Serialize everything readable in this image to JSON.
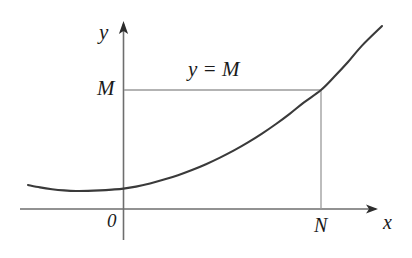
{
  "figure": {
    "kind": "function-graph",
    "width": 412,
    "height": 258,
    "background_color": "#ffffff"
  },
  "labels": {
    "y_axis": "y",
    "x_axis": "x",
    "origin": "0",
    "threshold_value": "M",
    "threshold_line": "y = M",
    "threshold_abscissa": "N"
  },
  "colors": {
    "curve": "#3a3a3a",
    "axis": "#6e6e6e",
    "guide_line": "#9a9a9a",
    "text": "#1a1a1a"
  },
  "chart_data": {
    "type": "line",
    "title": "",
    "xlabel": "x",
    "ylabel": "y",
    "grid": false,
    "legend": null,
    "axes": {
      "x_axis_pixel_y": 209,
      "y_axis_pixel_x": 123.5,
      "x_axis_start_px": 20,
      "x_axis_arrow_tip_px": 378,
      "y_axis_arrow_tip_px": 22,
      "y_axis_bottom_px": 240,
      "origin_px": [
        123.5,
        209
      ]
    },
    "series": [
      {
        "name": "f(x)",
        "description": "convex increasing curve with shallow minimum left of the y-axis",
        "points_px": [
          [
            28,
            185.0
          ],
          [
            40,
            187.4
          ],
          [
            52,
            189.2
          ],
          [
            64,
            190.4
          ],
          [
            76,
            191.0
          ],
          [
            88,
            190.9
          ],
          [
            100,
            190.4
          ],
          [
            112,
            189.6
          ],
          [
            123.5,
            188.6
          ],
          [
            136,
            186.6
          ],
          [
            150,
            183.4
          ],
          [
            164,
            179.6
          ],
          [
            178,
            175.2
          ],
          [
            192,
            170.0
          ],
          [
            206,
            164.2
          ],
          [
            220,
            157.6
          ],
          [
            234,
            150.4
          ],
          [
            248,
            142.4
          ],
          [
            262,
            133.6
          ],
          [
            276,
            124.0
          ],
          [
            290,
            113.6
          ],
          [
            304,
            102.4
          ],
          [
            321,
            90.0
          ],
          [
            334,
            77.0
          ],
          [
            348,
            62.0
          ],
          [
            362,
            45.6
          ],
          [
            382,
            26.0
          ]
        ]
      }
    ],
    "annotations": [
      {
        "name": "threshold-horizontal-line",
        "label": "y = M",
        "kind": "horizontal-guide",
        "from_px": [
          124,
          90
        ],
        "to_px": [
          321,
          90
        ]
      },
      {
        "name": "threshold-vertical-line",
        "label": "N",
        "kind": "vertical-guide",
        "from_px": [
          321,
          90
        ],
        "to_px": [
          321,
          209
        ]
      },
      {
        "name": "intersection-point",
        "label": "(N, M)",
        "kind": "point",
        "at_px": [
          321,
          90
        ]
      }
    ]
  }
}
